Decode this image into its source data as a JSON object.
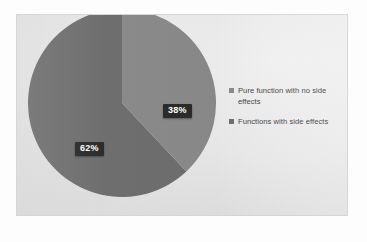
{
  "chart_data": {
    "type": "pie",
    "title": "",
    "categories": [
      "Pure function with no side effects",
      "Functions with side effects"
    ],
    "values": [
      38,
      62
    ],
    "value_labels": [
      "38%",
      "62%"
    ],
    "colors": [
      "#8a8a8a",
      "#6e6e6e"
    ],
    "legend_position": "right",
    "grid": false,
    "start_angle_deg": 0,
    "direction": "clockwise"
  },
  "legend": {
    "items": [
      {
        "label": "Pure function with no side effects",
        "marker_color": "#8a8a8a",
        "marker": "square-marker"
      },
      {
        "label": "Functions with side effects",
        "marker_color": "#6e6e6e",
        "marker": "square-marker"
      }
    ]
  },
  "labels": {
    "slice_0": "38%",
    "slice_1": "62%"
  },
  "theme": {
    "slice_light": "#8a8a8a",
    "slice_dark": "#6e6e6e",
    "label_box": "#2b2b2b",
    "label_text": "#ffffff",
    "frame_border": "#d6d6d6",
    "legend_text": "#3f3f3f"
  }
}
